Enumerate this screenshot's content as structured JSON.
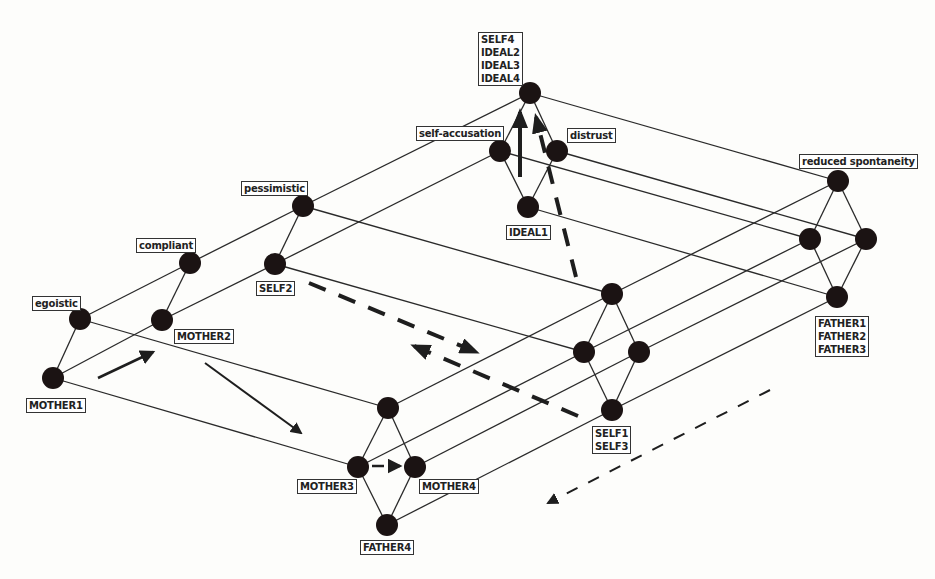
{
  "diagram": {
    "type": "concept-lattice",
    "colors": {
      "node": "#1b1313",
      "edge": "#2a2a2a",
      "arrow": "#1e1e1e",
      "label_border": "#333333"
    },
    "nodes": [
      {
        "id": "mother1",
        "x": 53,
        "y": 378,
        "label": "MOTHER1",
        "label_pos": "below"
      },
      {
        "id": "egoistic",
        "x": 80,
        "y": 319,
        "label": "egoistic",
        "label_pos": "above"
      },
      {
        "id": "mother2",
        "x": 162,
        "y": 320,
        "label": "MOTHER2",
        "label_pos": "below-right"
      },
      {
        "id": "compliant",
        "x": 190,
        "y": 263,
        "label": "compliant",
        "label_pos": "above"
      },
      {
        "id": "self2",
        "x": 275,
        "y": 264,
        "label": "SELF2",
        "label_pos": "below"
      },
      {
        "id": "pessimistic",
        "x": 303,
        "y": 206,
        "label": "pessimistic",
        "label_pos": "above"
      },
      {
        "id": "top",
        "x": 530,
        "y": 93,
        "label": "SELF4\nIDEAL2\nIDEAL3\nIDEAL4",
        "label_pos": "above"
      },
      {
        "id": "self_accusation",
        "x": 500,
        "y": 151,
        "label": "self-accusation",
        "label_pos": "above-left"
      },
      {
        "id": "distrust",
        "x": 557,
        "y": 151,
        "label": "distrust",
        "label_pos": "above-right"
      },
      {
        "id": "ideal1",
        "x": 528,
        "y": 207,
        "label": "IDEAL1",
        "label_pos": "below"
      },
      {
        "id": "reduced_spontaneity",
        "x": 838,
        "y": 181,
        "label": "reduced spontaneity",
        "label_pos": "above"
      },
      {
        "id": "r_left",
        "x": 810,
        "y": 239,
        "label": ""
      },
      {
        "id": "r_right",
        "x": 866,
        "y": 239,
        "label": ""
      },
      {
        "id": "father123",
        "x": 837,
        "y": 297,
        "label": "FATHER1\nFATHER2\nFATHER3",
        "label_pos": "below"
      },
      {
        "id": "m_top",
        "x": 612,
        "y": 294,
        "label": ""
      },
      {
        "id": "m_left",
        "x": 584,
        "y": 352,
        "label": ""
      },
      {
        "id": "m_right",
        "x": 639,
        "y": 352,
        "label": ""
      },
      {
        "id": "self13",
        "x": 612,
        "y": 410,
        "label": "SELF1\nSELF3",
        "label_pos": "below"
      },
      {
        "id": "b_top",
        "x": 388,
        "y": 408,
        "label": ""
      },
      {
        "id": "mother3",
        "x": 358,
        "y": 467,
        "label": "MOTHER3",
        "label_pos": "below-left"
      },
      {
        "id": "mother4",
        "x": 415,
        "y": 467,
        "label": "MOTHER4",
        "label_pos": "below-right"
      },
      {
        "id": "father4",
        "x": 387,
        "y": 525,
        "label": "FATHER4",
        "label_pos": "below"
      }
    ],
    "edges": [
      [
        "mother1",
        "egoistic"
      ],
      [
        "mother1",
        "mother2"
      ],
      [
        "egoistic",
        "compliant"
      ],
      [
        "mother2",
        "compliant"
      ],
      [
        "mother2",
        "self2"
      ],
      [
        "compliant",
        "pessimistic"
      ],
      [
        "self2",
        "pessimistic"
      ],
      [
        "pessimistic",
        "top"
      ],
      [
        "self2",
        "self_accusation"
      ],
      [
        "top",
        "self_accusation"
      ],
      [
        "top",
        "distrust"
      ],
      [
        "self_accusation",
        "ideal1"
      ],
      [
        "distrust",
        "ideal1"
      ],
      [
        "top",
        "reduced_spontaneity"
      ],
      [
        "self_accusation",
        "r_left"
      ],
      [
        "distrust",
        "r_right"
      ],
      [
        "ideal1",
        "father123"
      ],
      [
        "reduced_spontaneity",
        "r_left"
      ],
      [
        "reduced_spontaneity",
        "r_right"
      ],
      [
        "r_left",
        "father123"
      ],
      [
        "r_right",
        "father123"
      ],
      [
        "pessimistic",
        "m_top"
      ],
      [
        "self2",
        "m_left"
      ],
      [
        "m_top",
        "m_left"
      ],
      [
        "m_top",
        "m_right"
      ],
      [
        "m_left",
        "self13"
      ],
      [
        "m_right",
        "self13"
      ],
      [
        "m_top",
        "reduced_spontaneity"
      ],
      [
        "m_left",
        "r_left"
      ],
      [
        "m_right",
        "r_right"
      ],
      [
        "self13",
        "father123"
      ],
      [
        "egoistic",
        "b_top"
      ],
      [
        "mother1",
        "mother3"
      ],
      [
        "b_top",
        "mother3"
      ],
      [
        "b_top",
        "mother4"
      ],
      [
        "mother3",
        "father4"
      ],
      [
        "mother4",
        "father4"
      ],
      [
        "b_top",
        "m_top"
      ],
      [
        "mother3",
        "m_left"
      ],
      [
        "mother4",
        "m_right"
      ],
      [
        "father4",
        "self13"
      ]
    ],
    "arrows": [
      {
        "from": [
          98,
          378
        ],
        "to": [
          153,
          352
        ],
        "style": "solid",
        "width": 2.5
      },
      {
        "from": [
          205,
          363
        ],
        "to": [
          301,
          433
        ],
        "style": "solid",
        "width": 2
      },
      {
        "from": [
          372,
          466
        ],
        "to": [
          400,
          466
        ],
        "style": "dashed",
        "width": 2.5
      },
      {
        "from": [
          309,
          283
        ],
        "to": [
          476,
          352
        ],
        "style": "dashed",
        "width": 4
      },
      {
        "from": [
          578,
          416
        ],
        "to": [
          414,
          346
        ],
        "style": "dashed",
        "width": 4
      },
      {
        "from": [
          520,
          177
        ],
        "to": [
          520,
          112
        ],
        "style": "solid",
        "width": 4
      },
      {
        "from": [
          576,
          277
        ],
        "to": [
          536,
          117
        ],
        "style": "dashed",
        "width": 4
      },
      {
        "from": [
          770,
          390
        ],
        "to": [
          548,
          503
        ],
        "style": "dashed",
        "width": 2
      }
    ]
  }
}
